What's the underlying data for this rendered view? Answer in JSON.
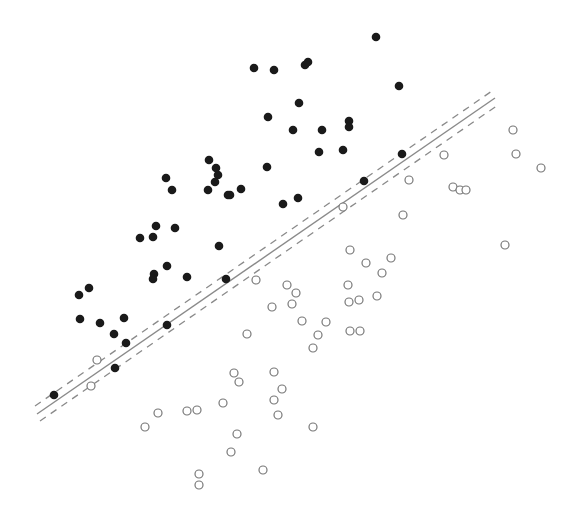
{
  "chart_data": {
    "type": "scatter",
    "title": "",
    "xlabel": "",
    "ylabel": "",
    "grid": false,
    "legend": null,
    "axes_visible": false,
    "colors": {
      "positive_fill": "#1a1a1a",
      "negative_stroke": "#777777",
      "line": "#8a8a8a",
      "background": "#ffffff"
    },
    "decision_boundary": {
      "style": "solid",
      "from": [
        37,
        414
      ],
      "to": [
        495,
        98
      ]
    },
    "margin_lines": [
      {
        "style": "dashed",
        "from": [
          35,
          406
        ],
        "to": [
          492,
          91
        ]
      },
      {
        "style": "dashed",
        "from": [
          40,
          421
        ],
        "to": [
          498,
          105
        ]
      }
    ],
    "series": [
      {
        "name": "filled",
        "marker": "filled-circle",
        "points": [
          [
            376,
            37
          ],
          [
            254,
            68
          ],
          [
            274,
            70
          ],
          [
            305,
            65
          ],
          [
            308,
            62
          ],
          [
            399,
            86
          ],
          [
            268,
            117
          ],
          [
            299,
            103
          ],
          [
            293,
            130
          ],
          [
            322,
            130
          ],
          [
            349,
            121
          ],
          [
            349,
            127
          ],
          [
            319,
            152
          ],
          [
            343,
            150
          ],
          [
            267,
            167
          ],
          [
            402,
            154
          ],
          [
            209,
            160
          ],
          [
            216,
            168
          ],
          [
            218,
            175
          ],
          [
            215,
            182
          ],
          [
            208,
            190
          ],
          [
            228,
            195
          ],
          [
            230,
            195
          ],
          [
            241,
            189
          ],
          [
            166,
            178
          ],
          [
            172,
            190
          ],
          [
            283,
            204
          ],
          [
            298,
            198
          ],
          [
            364,
            181
          ],
          [
            156,
            226
          ],
          [
            175,
            228
          ],
          [
            140,
            238
          ],
          [
            153,
            237
          ],
          [
            219,
            246
          ],
          [
            167,
            266
          ],
          [
            154,
            274
          ],
          [
            153,
            279
          ],
          [
            187,
            277
          ],
          [
            226,
            279
          ],
          [
            79,
            295
          ],
          [
            89,
            288
          ],
          [
            80,
            319
          ],
          [
            100,
            323
          ],
          [
            124,
            318
          ],
          [
            114,
            334
          ],
          [
            126,
            343
          ],
          [
            167,
            325
          ],
          [
            115,
            368
          ],
          [
            54,
            395
          ]
        ]
      },
      {
        "name": "hollow",
        "marker": "open-circle",
        "points": [
          [
            513,
            130
          ],
          [
            516,
            154
          ],
          [
            541,
            168
          ],
          [
            444,
            155
          ],
          [
            409,
            180
          ],
          [
            453,
            187
          ],
          [
            460,
            190
          ],
          [
            466,
            190
          ],
          [
            343,
            207
          ],
          [
            403,
            215
          ],
          [
            505,
            245
          ],
          [
            350,
            250
          ],
          [
            366,
            263
          ],
          [
            391,
            258
          ],
          [
            382,
            273
          ],
          [
            348,
            285
          ],
          [
            256,
            280
          ],
          [
            287,
            285
          ],
          [
            296,
            293
          ],
          [
            292,
            304
          ],
          [
            349,
            302
          ],
          [
            359,
            300
          ],
          [
            377,
            296
          ],
          [
            272,
            307
          ],
          [
            302,
            321
          ],
          [
            326,
            322
          ],
          [
            318,
            335
          ],
          [
            313,
            348
          ],
          [
            350,
            331
          ],
          [
            360,
            331
          ],
          [
            247,
            334
          ],
          [
            97,
            360
          ],
          [
            91,
            386
          ],
          [
            234,
            373
          ],
          [
            239,
            382
          ],
          [
            274,
            372
          ],
          [
            282,
            389
          ],
          [
            274,
            400
          ],
          [
            278,
            415
          ],
          [
            223,
            403
          ],
          [
            158,
            413
          ],
          [
            187,
            411
          ],
          [
            197,
            410
          ],
          [
            145,
            427
          ],
          [
            237,
            434
          ],
          [
            231,
            452
          ],
          [
            313,
            427
          ],
          [
            199,
            474
          ],
          [
            199,
            485
          ],
          [
            263,
            470
          ]
        ]
      }
    ]
  }
}
